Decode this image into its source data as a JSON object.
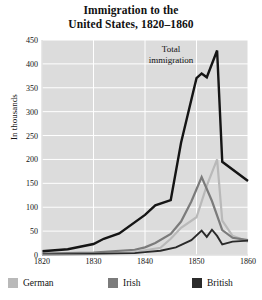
{
  "chart_data": {
    "type": "line",
    "title": "Immigration to the United States, 1820–1860",
    "title_line1": "Immigration to the",
    "title_line2": "United States, 1820–1860",
    "xlabel": "",
    "ylabel": "In thousands",
    "xlim": [
      1820,
      1860
    ],
    "ylim": [
      0,
      450
    ],
    "ytick_labels": [
      "0",
      "50",
      "100",
      "150",
      "200",
      "250",
      "300",
      "350",
      "400",
      "450"
    ],
    "ytick_values": [
      0,
      50,
      100,
      150,
      200,
      250,
      300,
      350,
      400,
      450
    ],
    "xtick_labels": [
      "1820",
      "1830",
      "1840",
      "1850",
      "1860"
    ],
    "xtick_values": [
      1820,
      1830,
      1840,
      1850,
      1860
    ],
    "grid": true,
    "grid_color": "#ffffff",
    "plot_background": "#dcdcdc",
    "legend_position": "below",
    "annotations": [
      {
        "text": "Total immigration",
        "line1": "Total",
        "line2": "immigration",
        "x": 1847,
        "y": 420
      }
    ],
    "series": [
      {
        "name": "Total",
        "legend_name": "British",
        "color": "#151515",
        "width": 2.4,
        "x": [
          1820,
          1825,
          1830,
          1832,
          1835,
          1840,
          1842,
          1845,
          1847,
          1850,
          1851,
          1852,
          1854,
          1855,
          1860
        ],
        "y": [
          8,
          12,
          23,
          34,
          45,
          84,
          104,
          115,
          235,
          370,
          380,
          372,
          428,
          195,
          155
        ]
      },
      {
        "name": "German",
        "legend_name": "German",
        "color": "#b9b9b9",
        "width": 2.2,
        "x": [
          1820,
          1830,
          1838,
          1840,
          1843,
          1845,
          1847,
          1850,
          1852,
          1854,
          1855,
          1857,
          1860
        ],
        "y": [
          1,
          2,
          6,
          10,
          15,
          34,
          57,
          79,
          145,
          200,
          72,
          40,
          28
        ]
      },
      {
        "name": "Irish",
        "legend_name": "Irish",
        "color": "#7b7b7b",
        "width": 2.2,
        "x": [
          1820,
          1830,
          1838,
          1840,
          1842,
          1845,
          1847,
          1849,
          1851,
          1853,
          1855,
          1857,
          1860
        ],
        "y": [
          3,
          5,
          11,
          16,
          25,
          44,
          70,
          112,
          163,
          113,
          52,
          36,
          31
        ]
      },
      {
        "name": "British",
        "legend_name": "British-low",
        "color": "#2a2a2a",
        "width": 1.9,
        "x": [
          1820,
          1830,
          1838,
          1840,
          1843,
          1846,
          1849,
          1851,
          1852,
          1853,
          1854,
          1855,
          1857,
          1860
        ],
        "y": [
          1,
          2,
          4,
          6,
          9,
          16,
          31,
          51,
          38,
          53,
          40,
          22,
          28,
          30
        ]
      }
    ],
    "legend": [
      {
        "label": "German",
        "color": "#b9b9b9"
      },
      {
        "label": "Irish",
        "color": "#7b7b7b"
      },
      {
        "label": "British",
        "color": "#2b2b2b"
      }
    ]
  }
}
